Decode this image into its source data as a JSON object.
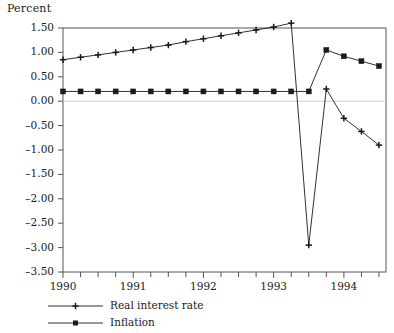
{
  "axis_title": "Percent",
  "y_ticks": [
    "1.50",
    "1.00",
    "0.50",
    "0.00",
    "-0.50",
    "-1.00",
    "-1.50",
    "-2.00",
    "-2.50",
    "-3.00",
    "-3.50"
  ],
  "x_ticks": [
    "1990",
    "1991",
    "1992",
    "1993",
    "1994"
  ],
  "legend": [
    {
      "label": "Real interest rate",
      "marker": "plus-marker"
    },
    {
      "label": "Inflation",
      "marker": "square-marker"
    }
  ],
  "colors": {
    "line": "#1a1a1a",
    "frame": "#555555",
    "zero_line": "#cccccc",
    "text": "#1a1a1a"
  },
  "chart_data": {
    "type": "line",
    "title": "",
    "xlabel": "",
    "ylabel": "Percent",
    "ylim": [
      -3.5,
      1.5
    ],
    "xlim": [
      1990.0,
      1994.6
    ],
    "grid": false,
    "legend_position": "below-left",
    "y_tick_values": [
      1.5,
      1.0,
      0.5,
      0.0,
      -0.5,
      -1.0,
      -1.5,
      -2.0,
      -2.5,
      -3.0,
      -3.5
    ],
    "x_tick_values": [
      1990,
      1991,
      1992,
      1993,
      1994
    ],
    "x_minor_tick_step": 0.25,
    "x": [
      1990.0,
      1990.25,
      1990.5,
      1990.75,
      1991.0,
      1991.25,
      1991.5,
      1991.75,
      1992.0,
      1992.25,
      1992.5,
      1992.75,
      1993.0,
      1993.25,
      1993.5,
      1993.75,
      1994.0,
      1994.25,
      1994.5
    ],
    "series": [
      {
        "name": "Real interest rate",
        "marker": "plus",
        "values": [
          0.85,
          0.9,
          0.95,
          1.0,
          1.05,
          1.1,
          1.15,
          1.22,
          1.28,
          1.34,
          1.4,
          1.46,
          1.52,
          1.6,
          -2.95,
          0.25,
          -0.35,
          -0.62,
          -0.9
        ]
      },
      {
        "name": "Inflation",
        "marker": "square",
        "values": [
          0.2,
          0.2,
          0.2,
          0.2,
          0.2,
          0.2,
          0.2,
          0.2,
          0.2,
          0.2,
          0.2,
          0.2,
          0.2,
          0.2,
          0.2,
          1.05,
          0.92,
          0.82,
          0.72
        ]
      }
    ]
  }
}
